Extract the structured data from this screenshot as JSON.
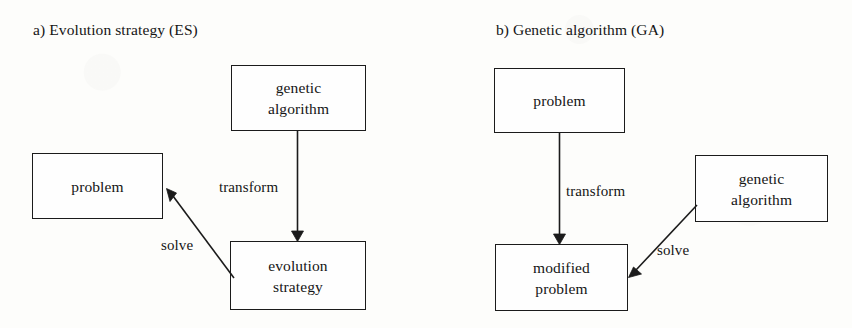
{
  "figure": {
    "width": 852,
    "height": 328,
    "background_color": "#fdfdfb",
    "stroke_color": "#1b1b1b",
    "text_color": "#151515"
  },
  "panels": [
    {
      "id": "panel-a",
      "title": "a) Evolution strategy (ES)",
      "nodes": [
        {
          "id": "a-genetic-algorithm",
          "lines": [
            "genetic",
            "algorithm"
          ],
          "x": 231,
          "y": 65,
          "w": 135,
          "h": 66
        },
        {
          "id": "a-problem",
          "lines": [
            "problem"
          ],
          "x": 32,
          "y": 153,
          "w": 131,
          "h": 66
        },
        {
          "id": "a-evolution-strategy",
          "lines": [
            "evolution",
            "strategy"
          ],
          "x": 230,
          "y": 241,
          "w": 136,
          "h": 69
        }
      ],
      "edges": [
        {
          "id": "a-transform-edge",
          "label": "transform",
          "from": "a-genetic-algorithm",
          "to": "a-evolution-strategy",
          "kind": "vertical-arrow"
        },
        {
          "id": "a-solve-edge",
          "label": "solve",
          "from": "a-evolution-strategy",
          "to": "a-problem",
          "kind": "diagonal-arrow"
        }
      ]
    },
    {
      "id": "panel-b",
      "title": "b) Genetic algorithm (GA)",
      "nodes": [
        {
          "id": "b-problem",
          "lines": [
            "problem"
          ],
          "x": 494,
          "y": 68,
          "w": 131,
          "h": 65
        },
        {
          "id": "b-genetic-algorithm",
          "lines": [
            "genetic",
            "algorithm"
          ],
          "x": 695,
          "y": 155,
          "w": 133,
          "h": 67
        },
        {
          "id": "b-modified-problem",
          "lines": [
            "modified",
            "problem"
          ],
          "x": 495,
          "y": 244,
          "w": 133,
          "h": 67
        }
      ],
      "edges": [
        {
          "id": "b-transform-edge",
          "label": "transform",
          "from": "b-problem",
          "to": "b-modified-problem",
          "kind": "vertical-arrow"
        },
        {
          "id": "b-solve-edge",
          "label": "solve",
          "from": "b-genetic-algorithm",
          "to": "b-modified-problem",
          "kind": "diagonal-arrow"
        }
      ]
    }
  ],
  "labels": {
    "panel_a_title": "a) Evolution strategy (ES)",
    "panel_b_title": "b) Genetic algorithm (GA)",
    "a_genetic_line1": "genetic",
    "a_genetic_line2": "algorithm",
    "a_problem": "problem",
    "a_evolution_line1": "evolution",
    "a_evolution_line2": "strategy",
    "a_transform": "transform",
    "a_solve": "solve",
    "b_problem": "problem",
    "b_genetic_line1": "genetic",
    "b_genetic_line2": "algorithm",
    "b_modified_line1": "modified",
    "b_modified_line2": "problem",
    "b_transform": "transform",
    "b_solve": "solve"
  }
}
